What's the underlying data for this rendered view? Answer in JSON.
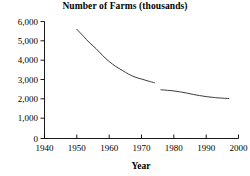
{
  "chart_data": {
    "type": "line",
    "title": "Number of Farms (thousands)",
    "xlabel": "Year",
    "ylabel": "",
    "xlim": [
      1940,
      2000
    ],
    "ylim": [
      0,
      6000
    ],
    "grid": false,
    "legend": null,
    "xticks": [
      1940,
      1950,
      1960,
      1970,
      1980,
      1990,
      2000
    ],
    "xtick_labels": [
      "1940",
      "1950",
      "1960",
      "1970",
      "1980",
      "1990",
      "2000"
    ],
    "yticks": [
      0,
      1000,
      2000,
      3000,
      4000,
      5000,
      6000
    ],
    "ytick_labels": [
      "0",
      "1,000",
      "2,000",
      "3,000",
      "4,000",
      "5,000",
      "6,000"
    ],
    "series": [
      {
        "name": "Number of Farms (thousands) — pre-1974 definition",
        "x": [
          1950,
          1952,
          1954,
          1956,
          1958,
          1960,
          1962,
          1964,
          1966,
          1968,
          1970,
          1972,
          1974
        ],
        "values": [
          5600,
          5250,
          4900,
          4600,
          4250,
          3950,
          3700,
          3500,
          3300,
          3150,
          3050,
          2950,
          2860
        ]
      },
      {
        "name": "Number of Farms (thousands) — post-1974 definition",
        "x": [
          1976,
          1978,
          1980,
          1982,
          1984,
          1986,
          1988,
          1990,
          1992,
          1994,
          1997
        ],
        "values": [
          2500,
          2470,
          2440,
          2390,
          2330,
          2260,
          2200,
          2150,
          2110,
          2080,
          2050
        ]
      }
    ]
  },
  "axis_color": "#000000",
  "line_color": "#262626",
  "background_color": "#ffffff"
}
